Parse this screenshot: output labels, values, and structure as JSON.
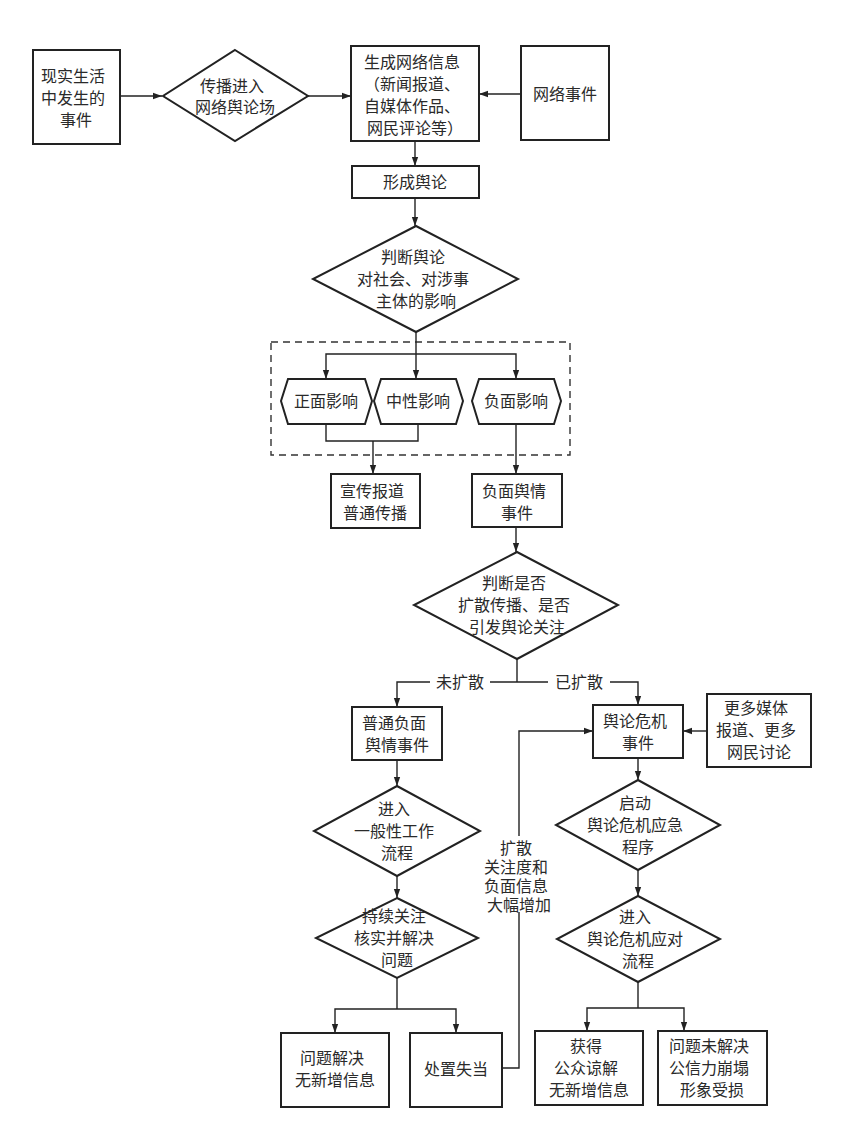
{
  "diagram": {
    "type": "flowchart",
    "colors": {
      "stroke": "#222222",
      "text": "#2a2a2a",
      "background": "#ffffff"
    },
    "nodes": {
      "real_event": {
        "shape": "rect",
        "lines": [
          "现实生活",
          "中发生的",
          "事件"
        ]
      },
      "spread_into_field": {
        "shape": "diamond",
        "lines": [
          "传播进入",
          "网络舆论场"
        ]
      },
      "generate_info": {
        "shape": "rect",
        "lines": [
          "生成网络信息",
          "（新闻报道、",
          "自媒体作品、",
          "网民评论等）"
        ]
      },
      "network_event": {
        "shape": "rect",
        "lines": [
          "网络事件"
        ]
      },
      "form_opinion": {
        "shape": "rect",
        "lines": [
          "形成舆论"
        ]
      },
      "judge_impact": {
        "shape": "diamond",
        "lines": [
          "判断舆论",
          "对社会、对涉事",
          "主体的影响"
        ]
      },
      "positive": {
        "shape": "hexagon",
        "lines": [
          "正面影响"
        ]
      },
      "neutral": {
        "shape": "hexagon",
        "lines": [
          "中性影响"
        ]
      },
      "negative": {
        "shape": "hexagon",
        "lines": [
          "负面影响"
        ]
      },
      "publicity": {
        "shape": "rect",
        "lines": [
          "宣传报道",
          "普通传播"
        ]
      },
      "negative_event": {
        "shape": "rect",
        "lines": [
          "负面舆情",
          "事件"
        ]
      },
      "judge_spread": {
        "shape": "diamond",
        "lines": [
          "判断是否",
          "扩散传播、是否",
          "引发舆论关注"
        ]
      },
      "ordinary_negative": {
        "shape": "rect",
        "lines": [
          "普通负面",
          "舆情事件"
        ]
      },
      "crisis_event": {
        "shape": "rect",
        "lines": [
          "舆论危机",
          "事件"
        ]
      },
      "more_media": {
        "shape": "rect",
        "lines": [
          "更多媒体",
          "报道、更多",
          "网民讨论"
        ]
      },
      "general_process": {
        "shape": "diamond",
        "lines": [
          "进入",
          "一般性工作",
          "流程"
        ]
      },
      "start_emergency": {
        "shape": "diamond",
        "lines": [
          "启动",
          "舆论危机应急",
          "程序"
        ]
      },
      "follow_resolve": {
        "shape": "diamond",
        "lines": [
          "持续关注",
          "核实并解决",
          "问题"
        ]
      },
      "crisis_response": {
        "shape": "diamond",
        "lines": [
          "进入",
          "舆论危机应对",
          "流程"
        ]
      },
      "resolved": {
        "shape": "rect",
        "lines": [
          "问题解决",
          "无新增信息"
        ]
      },
      "mishandled": {
        "shape": "rect",
        "lines": [
          "处置失当"
        ]
      },
      "understood": {
        "shape": "rect",
        "lines": [
          "获得",
          "公众谅解",
          "无新增信息"
        ]
      },
      "unresolved": {
        "shape": "rect",
        "lines": [
          "问题未解决",
          "公信力崩塌",
          "形象受损"
        ]
      }
    },
    "edge_labels": {
      "not_spread": "未扩散",
      "spread": "已扩散",
      "feedback": [
        "扩散",
        "关注度和",
        "负面信息",
        "大幅增加"
      ]
    }
  }
}
